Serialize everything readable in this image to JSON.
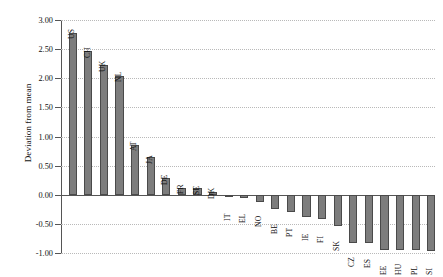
{
  "chart_data": {
    "type": "bar",
    "title": "",
    "xlabel": "",
    "ylabel": "Deviation from mean",
    "ylim": [
      -1.0,
      3.0
    ],
    "ytick_step": 0.5,
    "ytick_labels": [
      "3.00",
      "2.50",
      "2.00",
      "1.50",
      "1.00",
      "0.50",
      "0.00",
      "-0.50",
      "-1.00"
    ],
    "ytick_values": [
      3.0,
      2.5,
      2.0,
      1.5,
      1.0,
      0.5,
      0.0,
      -0.5,
      -1.0
    ],
    "grid": true,
    "legend": "none",
    "bar_color": "#7d7d7d",
    "bar_border_color": "#4a4a4a",
    "categories": [
      "US",
      "CH",
      "UK",
      "NL",
      "AT",
      "JA",
      "DE",
      "FR",
      "SE",
      "DK",
      "IT",
      "EL",
      "NO",
      "BE",
      "PT",
      "IE",
      "FI",
      "SK",
      "CZ",
      "ES",
      "EE",
      "HU",
      "PL",
      "SI"
    ],
    "values": [
      2.78,
      2.46,
      2.22,
      2.04,
      0.86,
      0.64,
      0.28,
      0.12,
      0.11,
      0.04,
      -0.03,
      -0.06,
      -0.13,
      -0.25,
      -0.3,
      -0.38,
      -0.41,
      -0.54,
      -0.82,
      -0.83,
      -0.95,
      -0.95,
      -0.95,
      -0.96
    ]
  }
}
